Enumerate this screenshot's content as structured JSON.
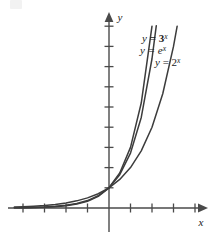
{
  "chart_data": {
    "type": "line",
    "title": "",
    "subtitle": "",
    "xlabel": "x",
    "ylabel": "y",
    "xlim": [
      -4.6,
      4.6
    ],
    "ylim": [
      -0.9,
      9.6
    ],
    "grid": false,
    "legend_position": "inline-right",
    "axis_style": "arrow-ended number lines with tick marks, no tick labels",
    "x_ticks": [
      -4,
      -3,
      -2,
      -1,
      1,
      2,
      3,
      4
    ],
    "y_ticks": [
      1,
      2,
      3,
      4,
      5,
      6,
      7,
      8,
      9
    ],
    "annotations": [
      {
        "text": "y = 3ˣ",
        "x": 1.75,
        "y": 8.5
      },
      {
        "text": "y = eˣ",
        "x": 1.75,
        "y": 7.6
      },
      {
        "text": "y = 2ˣ",
        "x": 2.5,
        "y": 6.7
      }
    ],
    "series": [
      {
        "name": "y = 3^x",
        "label_base": "y = 3",
        "label_exponent": "x",
        "bold_label": true,
        "function": "3^x",
        "base": 3,
        "color": "#3c3c3c",
        "x": [
          -4.4,
          -4,
          -3.5,
          -3,
          -2.5,
          -2,
          -1.5,
          -1,
          -0.5,
          0,
          0.5,
          1,
          1.5,
          2
        ],
        "values": [
          0.0105,
          0.0123,
          0.0214,
          0.037,
          0.0642,
          0.1111,
          0.1925,
          0.3333,
          0.5774,
          1,
          1.7321,
          3,
          5.1962,
          9
        ]
      },
      {
        "name": "y = e^x",
        "label_base": "y = e",
        "label_exponent": "x",
        "bold_label": false,
        "function": "e^x",
        "base": 2.71828,
        "color": "#3c3c3c",
        "x": [
          -4.4,
          -4,
          -3.5,
          -3,
          -2.5,
          -2,
          -1.5,
          -1,
          -0.5,
          0,
          0.5,
          1,
          1.5,
          2,
          2.2
        ],
        "values": [
          0.0123,
          0.0183,
          0.0302,
          0.0498,
          0.0821,
          0.1353,
          0.2231,
          0.3679,
          0.6065,
          1,
          1.6487,
          2.7183,
          4.4817,
          7.3891,
          9.025
        ]
      },
      {
        "name": "y = 2^x",
        "label_base": "y = 2",
        "label_exponent": "x",
        "bold_label": false,
        "function": "2^x",
        "base": 2,
        "color": "#3c3c3c",
        "x": [
          -4.4,
          -4,
          -3.5,
          -3,
          -2.5,
          -2,
          -1.5,
          -1,
          -0.5,
          0,
          0.5,
          1,
          1.5,
          2,
          2.5,
          3,
          3.17
        ],
        "values": [
          0.0474,
          0.0625,
          0.0884,
          0.125,
          0.1768,
          0.25,
          0.3536,
          0.5,
          0.7071,
          1,
          1.4142,
          2,
          2.8284,
          4,
          5.6569,
          8,
          9.0
        ]
      }
    ]
  },
  "axes": {
    "x_label": "x",
    "y_label": "y"
  },
  "colors": {
    "axis": "#4a4a4a",
    "curve": "#3c3c3c",
    "text": "#1a1a1a",
    "background": "#ffffff"
  }
}
